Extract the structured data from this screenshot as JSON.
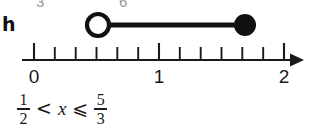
{
  "part_label": "h",
  "bleed_text": {
    "left_glyph": "3",
    "right_glyph": "6"
  },
  "number_line": {
    "axis_labels": [
      "0",
      "1",
      "2"
    ],
    "axis_label_values": [
      0,
      1,
      2
    ],
    "axis_min": 0,
    "axis_max": 2,
    "tick_count": 13,
    "tick_step": "1/6",
    "tick_values": [
      0,
      0.1667,
      0.3333,
      0.5,
      0.6667,
      0.8333,
      1,
      1.1667,
      1.3333,
      1.5,
      1.6667,
      1.8333,
      2
    ],
    "major_tick_values": [
      0,
      1,
      2
    ],
    "arrow_direction": "right",
    "line_color": "#1a1a1a"
  },
  "interval": {
    "start_value": 0.5,
    "start_label": "1/2",
    "start_endpoint": "open",
    "end_value": 1.6667,
    "end_label": "5/3",
    "end_endpoint": "closed",
    "segment_color": "#111111"
  },
  "inequality": {
    "left_numerator": "1",
    "left_denominator": "2",
    "first_operator": "<",
    "variable": "x",
    "second_operator": "⩽",
    "right_numerator": "5",
    "right_denominator": "3",
    "plain_text": "1/2 < x ⩽ 5/3"
  }
}
